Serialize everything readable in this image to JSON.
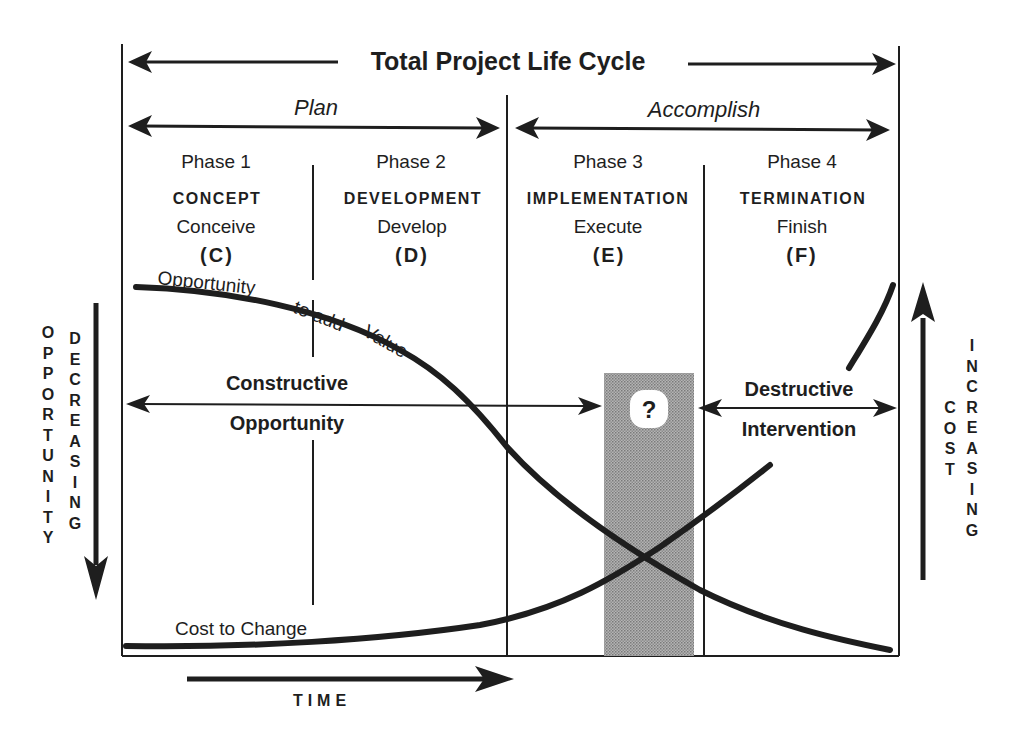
{
  "diagram": {
    "title": "Total Project Life Cycle",
    "groups": [
      {
        "label": "Plan"
      },
      {
        "label": "Accomplish"
      }
    ],
    "phases": [
      {
        "number": "Phase 1",
        "name": "CONCEPT",
        "verb": "Conceive",
        "code": "(C)"
      },
      {
        "number": "Phase 2",
        "name": "DEVELOPMENT",
        "verb": "Develop",
        "code": "(D)"
      },
      {
        "number": "Phase 3",
        "name": "IMPLEMENTATION",
        "verb": "Execute",
        "code": "(E)"
      },
      {
        "number": "Phase 4",
        "name": "TERMINATION",
        "verb": "Finish",
        "code": "(F)"
      }
    ],
    "curves": {
      "opportunity": {
        "label_part1": "Opportunity",
        "label_part2": "to add",
        "label_part3": "Value"
      },
      "cost": {
        "label": "Cost to Change"
      }
    },
    "zones": {
      "constructive": {
        "line1": "Constructive",
        "line2": "Opportunity"
      },
      "destructive": {
        "line1": "Destructive",
        "line2": "Intervention"
      },
      "unknown_marker": "?"
    },
    "left_axis": {
      "col1": [
        "O",
        "P",
        "P",
        "O",
        "R",
        "T",
        "U",
        "N",
        "I",
        "T",
        "Y"
      ],
      "col2": [
        "D",
        "E",
        "C",
        "R",
        "E",
        "A",
        "S",
        "I",
        "N",
        "G"
      ]
    },
    "right_axis": {
      "col1": [
        "C",
        "O",
        "S",
        "T"
      ],
      "col2": [
        "I",
        "N",
        "C",
        "R",
        "E",
        "A",
        "S",
        "I",
        "N",
        "G"
      ]
    },
    "time_axis": {
      "label": "TIME"
    },
    "colors": {
      "ink": "#1e1e1e",
      "shade": "#9a9a9a",
      "background": "#ffffff"
    }
  }
}
